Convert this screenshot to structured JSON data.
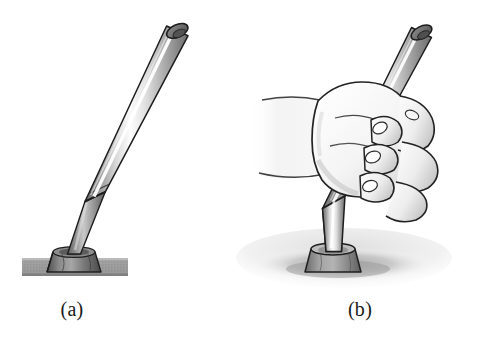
{
  "figure": {
    "background_color": "#ffffff",
    "width": 477,
    "height": 352,
    "panels": [
      {
        "id": "a",
        "label": "(a)",
        "caption_x": 72,
        "caption_y": 310,
        "description": "Metal rod standing upright in a conical base socket resting on a textured slab",
        "objects": [
          {
            "name": "rod",
            "kind": "cylinder",
            "top_x": 178,
            "top_y": 30,
            "bottom_x": 95,
            "bottom_y": 205,
            "radius": 11,
            "tilt_degrees": 25,
            "color_light": "#fcfcfc",
            "color_mid": "#b6b6b6",
            "color_dark": "#6e6e6e"
          },
          {
            "name": "ferrule-taper",
            "kind": "cone",
            "top_x": 95,
            "top_y": 205,
            "bottom_x": 73,
            "bottom_y": 252,
            "top_radius": 11,
            "bottom_radius": 6,
            "color_mid": "#8f8f8f"
          },
          {
            "name": "base-socket",
            "kind": "truncated-cone",
            "center_x": 74,
            "top_y": 252,
            "bottom_y": 273,
            "top_radius": 21,
            "bottom_radius": 27,
            "color_mid": "#6f6f6f"
          },
          {
            "name": "ground-slab",
            "kind": "rectangle",
            "x": 22,
            "y": 258,
            "width": 106,
            "height": 18,
            "color": "#9a9a9a",
            "texture": "stipple"
          }
        ]
      },
      {
        "id": "b",
        "label": "(b)",
        "caption_x": 360,
        "caption_y": 310,
        "description": "Hand gripping the rod which is seated in the base socket on a soft shaded surface",
        "objects": [
          {
            "name": "rod",
            "kind": "cylinder",
            "top_x": 421,
            "top_y": 32,
            "bottom_x": 332,
            "bottom_y": 212,
            "radius": 11,
            "tilt_degrees": 26,
            "color_light": "#fafafa",
            "color_mid": "#b4b4b4",
            "color_dark": "#6e6e6e"
          },
          {
            "name": "ferrule-taper",
            "kind": "cone",
            "top_x": 332,
            "top_y": 212,
            "bottom_x": 318,
            "bottom_y": 250,
            "top_radius": 11,
            "bottom_radius": 7,
            "color_mid": "#8d8d8d"
          },
          {
            "name": "base-socket",
            "kind": "truncated-cone",
            "center_x": 333,
            "top_y": 249,
            "bottom_y": 274,
            "top_radius": 22,
            "bottom_radius": 27,
            "color_mid": "#8a8a8a"
          },
          {
            "name": "hand",
            "kind": "fist-grip",
            "center_x": 370,
            "center_y": 140,
            "finger_count": 4,
            "nail_count": 3,
            "color_fill": "#f7f7f7",
            "color_shadow": "#cfcfcf",
            "color_outline": "#2b2b2b"
          },
          {
            "name": "forearm",
            "kind": "soft-gradient-limb",
            "x": 248,
            "y": 96,
            "width": 110,
            "height": 80
          },
          {
            "name": "ground-shadow",
            "kind": "soft-ellipse",
            "center_x": 342,
            "center_y": 262,
            "radius_x": 92,
            "radius_y": 22,
            "color": "#b9b9b9"
          }
        ]
      }
    ],
    "palette": {
      "outline": "#232323",
      "metal_highlight": "#ffffff",
      "metal_mid": "#b0b0b0",
      "metal_shadow": "#5f5f5f",
      "base_dark": "#5a5a5a",
      "slab_gray": "#9a9a9a",
      "skin_light": "#fbfbfb",
      "skin_shade": "#d2d2d2",
      "shadow_gray": "#bdbdbd",
      "label_color": "#1a1a1a"
    }
  }
}
